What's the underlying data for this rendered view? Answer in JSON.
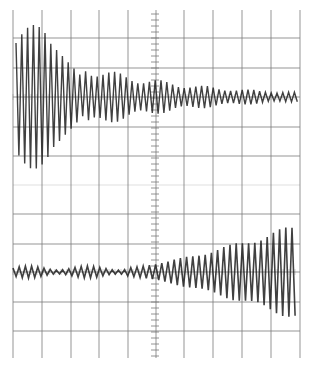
{
  "figure": {
    "background": "#ffffff",
    "grid_color": "#7a7a7a",
    "trace_color": "#1e1e1e",
    "graticule": {
      "x_lines": [
        13,
        42,
        71,
        99,
        128,
        156,
        184,
        213,
        242,
        271,
        300
      ],
      "y_lines": [
        38,
        68,
        97,
        127,
        156,
        214,
        244,
        272,
        302,
        331
      ],
      "faint_y_line": 185,
      "top": 10,
      "bottom": 358,
      "center_x": 155
    },
    "traces": [
      {
        "name": "upper-trace",
        "baseline_y": 97,
        "shape": "decaying oscillation",
        "start_x": 16,
        "end_x": 300,
        "initial_amplitude": 72,
        "final_amplitude": 3
      },
      {
        "name": "lower-trace",
        "baseline_y": 272,
        "shape": "growing oscillation",
        "start_x": 13,
        "end_x": 298,
        "initial_amplitude": 4,
        "final_amplitude": 45
      }
    ]
  }
}
